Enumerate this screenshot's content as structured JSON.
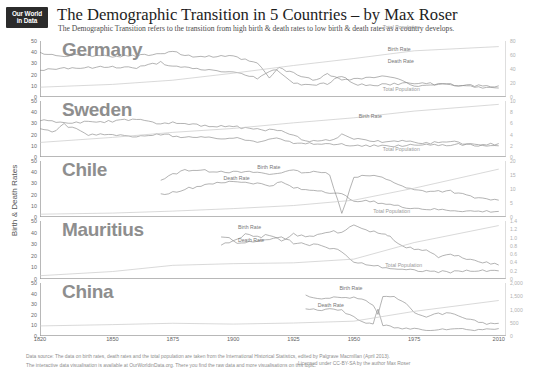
{
  "header": {
    "logo_line1": "Our World",
    "logo_line2": "in Data",
    "title": "The Demographic Transition in 5 Countries – by Max Roser",
    "subtitle": "The Demographic Transition refers to the transition from high birth & death rates to low birth & death rates as a country develops."
  },
  "axes": {
    "y_left_title": "Birth & Death Rates",
    "y_right_title": "Total Population (in Millions)",
    "x_ticks": [
      "1820",
      "1850",
      "1875",
      "1900",
      "1925",
      "1950",
      "1975",
      "2010"
    ]
  },
  "series_labels": {
    "birth": "Birth Rate",
    "death": "Death Rate",
    "population": "Total Population"
  },
  "footer": {
    "line1": "Data source: The data on birth rates, death rates and the total population are taken from the International Historical Statistics, edited by Palgrave Macmillan (April 2013).",
    "line2": "The interactive data visualisation is available at OurWorldinData.org. There you find the raw data and more visualisations on this topic.",
    "license": "Licensed under CC-BY-SA by the author Max Roser"
  },
  "chart_data": {
    "type": "line",
    "title": "The Demographic Transition in 5 Countries – by Max Roser",
    "xlabel": "",
    "ylabel": "Birth & Death Rates",
    "y2label": "Total Population (in Millions)",
    "xlim": [
      1820,
      2013
    ],
    "grid": false,
    "legend_position": "inline-annotations",
    "panels": [
      {
        "country": "Germany",
        "ylim": [
          0,
          50
        ],
        "y_ticks": [
          0,
          10,
          20,
          30,
          40,
          50
        ],
        "y2lim": [
          0,
          80
        ],
        "y2_ticks": [
          "0",
          "20",
          "40",
          "60",
          "80"
        ],
        "series": [
          {
            "name": "Birth Rate",
            "label_x": 1964,
            "label_y": 42,
            "x": [
              1820,
              1830,
              1840,
              1850,
              1860,
              1870,
              1875,
              1880,
              1890,
              1900,
              1910,
              1915,
              1919,
              1925,
              1933,
              1939,
              1945,
              1950,
              1960,
              1965,
              1970,
              1975,
              1980,
              1990,
              2000,
              2010
            ],
            "values": [
              39,
              37,
              37,
              36,
              37,
              39,
              41,
              37,
              36,
              36,
              30,
              17,
              26,
              21,
              15,
              20,
              16,
              16,
              18,
              18,
              14,
              10,
              11,
              11,
              9,
              8
            ]
          },
          {
            "name": "Death Rate",
            "label_x": 1964,
            "label_y": 31,
            "x": [
              1820,
              1830,
              1840,
              1850,
              1860,
              1870,
              1875,
              1880,
              1890,
              1900,
              1910,
              1915,
              1918,
              1925,
              1933,
              1939,
              1945,
              1950,
              1960,
              1970,
              1980,
              1990,
              2000,
              2010
            ],
            "values": [
              24,
              26,
              26,
              27,
              26,
              31,
              27,
              26,
              24,
              22,
              17,
              22,
              25,
              12,
              11,
              12,
              19,
              11,
              11,
              12,
              12,
              11,
              10,
              10
            ]
          },
          {
            "name": "Total Population",
            "label_x": 1962,
            "label_y": 62,
            "x": [
              1820,
              1850,
              1875,
              1900,
              1925,
              1950,
              1975,
              2010
            ],
            "values": [
              14,
              18,
              24,
              34,
              45,
              55,
              66,
              72
            ]
          }
        ]
      },
      {
        "country": "Sweden",
        "ylim": [
          0,
          50
        ],
        "y_ticks": [
          0,
          10,
          20,
          30,
          40,
          50
        ],
        "y2lim": [
          0,
          10
        ],
        "y2_ticks": [
          "0",
          "2",
          "4",
          "6",
          "8",
          "10"
        ],
        "series": [
          {
            "name": "Birth Rate",
            "label_x": 1952,
            "label_y": 36,
            "x": [
              1820,
              1830,
              1840,
              1850,
              1860,
              1870,
              1875,
              1880,
              1890,
              1900,
              1910,
              1920,
              1925,
              1930,
              1935,
              1940,
              1945,
              1950,
              1960,
              1970,
              1980,
              1990,
              2000,
              2010
            ],
            "values": [
              33,
              31,
              31,
              32,
              34,
              29,
              31,
              29,
              28,
              27,
              25,
              23,
              19,
              15,
              14,
              15,
              20,
              16,
              14,
              14,
              12,
              14,
              10,
              12
            ]
          },
          {
            "name": "Death Rate",
            "label_x": 0,
            "label_y": 0,
            "x": [
              1820,
              1825,
              1830,
              1840,
              1850,
              1860,
              1870,
              1875,
              1880,
              1890,
              1900,
              1910,
              1918,
              1925,
              1935,
              1945,
              1950,
              1960,
              1970,
              1980,
              1990,
              2000,
              2010
            ],
            "values": [
              25,
              22,
              29,
              20,
              20,
              18,
              20,
              19,
              18,
              17,
              17,
              14,
              18,
              12,
              12,
              11,
              10,
              10,
              10,
              11,
              11,
              11,
              10
            ]
          },
          {
            "name": "Total Population",
            "label_x": 1962,
            "label_y": 60,
            "x": [
              1820,
              1850,
              1875,
              1900,
              1925,
              1950,
              1975,
              2010
            ],
            "values": [
              2.6,
              3.5,
              4.4,
              5.1,
              6.1,
              7.0,
              8.2,
              9.4
            ]
          }
        ]
      },
      {
        "country": "Chile",
        "ylim": [
          0,
          50
        ],
        "y_ticks": [
          0,
          10,
          20,
          30,
          40,
          50
        ],
        "y2lim": [
          0,
          20
        ],
        "y2_ticks": [
          "0",
          "5",
          "10",
          "15",
          "20"
        ],
        "series": [
          {
            "name": "Birth Rate",
            "label_x": 1910,
            "label_y": 44,
            "x": [
              1870,
              1875,
              1880,
              1885,
              1890,
              1895,
              1900,
              1905,
              1910,
              1915,
              1920,
              1925,
              1930,
              1935,
              1940,
              1945,
              1950,
              1955,
              1960,
              1965,
              1970,
              1975,
              1980,
              1990,
              2000,
              2010
            ],
            "values": [
              33,
              38,
              42,
              42,
              41,
              41,
              40,
              40,
              40,
              38,
              40,
              41,
              40,
              40,
              38,
              3,
              36,
              37,
              36,
              33,
              27,
              24,
              23,
              23,
              17,
              15
            ]
          },
          {
            "name": "Death Rate",
            "label_x": 1896,
            "label_y": 34,
            "x": [
              1870,
              1875,
              1880,
              1885,
              1890,
              1895,
              1900,
              1905,
              1910,
              1915,
              1920,
              1925,
              1930,
              1935,
              1940,
              1945,
              1950,
              1960,
              1970,
              1980,
              1990,
              2000,
              2010
            ],
            "values": [
              20,
              22,
              25,
              27,
              30,
              30,
              32,
              31,
              30,
              28,
              31,
              26,
              24,
              24,
              22,
              20,
              15,
              13,
              9,
              7,
              6,
              5,
              5
            ]
          },
          {
            "name": "Total Population",
            "label_x": 1962,
            "label_y": 60,
            "x": [
              1820,
              1850,
              1875,
              1900,
              1925,
              1950,
              1975,
              2010
            ],
            "values": [
              1.0,
              1.4,
              2.1,
              3.0,
              4.1,
              6.0,
              10.3,
              17.1
            ]
          }
        ]
      },
      {
        "country": "Mauritius",
        "ylim": [
          0,
          50
        ],
        "y_ticks": [
          0,
          10,
          20,
          30,
          40,
          50
        ],
        "y2lim": [
          0,
          1.4
        ],
        "y2_ticks": [
          "0",
          "0.2",
          "0.4",
          "0.6",
          "0.8",
          "1.0",
          "1.2",
          "1.4"
        ],
        "series": [
          {
            "name": "Birth Rate",
            "label_x": 1902,
            "label_y": 44,
            "x": [
              1895,
              1900,
              1905,
              1910,
              1915,
              1920,
              1925,
              1930,
              1935,
              1940,
              1945,
              1950,
              1955,
              1960,
              1963,
              1965,
              1970,
              1975,
              1980,
              1985,
              1990,
              2000,
              2010
            ],
            "values": [
              36,
              34,
              38,
              36,
              38,
              33,
              39,
              36,
              38,
              41,
              40,
              47,
              42,
              40,
              39,
              36,
              28,
              26,
              25,
              19,
              21,
              16,
              12
            ]
          },
          {
            "name": "Death Rate",
            "label_x": 1902,
            "label_y": 33,
            "x": [
              1895,
              1900,
              1905,
              1910,
              1915,
              1920,
              1925,
              1930,
              1935,
              1940,
              1945,
              1950,
              1955,
              1960,
              1970,
              1980,
              1990,
              2000,
              2010
            ],
            "values": [
              30,
              32,
              31,
              33,
              34,
              36,
              31,
              30,
              29,
              27,
              24,
              14,
              13,
              11,
              8,
              7,
              6,
              7,
              7
            ]
          },
          {
            "name": "Total Population",
            "label_x": 1958,
            "label_y": 58,
            "x": [
              1820,
              1850,
              1875,
              1900,
              1925,
              1950,
              1975,
              2010
            ],
            "values": [
              0.08,
              0.18,
              0.33,
              0.37,
              0.39,
              0.48,
              0.88,
              1.29
            ]
          }
        ]
      },
      {
        "country": "China",
        "ylim": [
          0,
          50
        ],
        "y_ticks": [
          0,
          10,
          20,
          30,
          40,
          50
        ],
        "y2lim": [
          0,
          2000
        ],
        "y2_ticks": [
          "0",
          "500",
          "1,000",
          "1,500",
          "2,000"
        ],
        "series": [
          {
            "name": "Birth Rate",
            "label_x": 1944,
            "label_y": 44,
            "x": [
              1930,
              1935,
              1940,
              1945,
              1950,
              1955,
              1958,
              1960,
              1962,
              1965,
              1970,
              1975,
              1980,
              1985,
              1990,
              1995,
              2000,
              2005,
              2010
            ],
            "values": [
              38,
              36,
              36,
              36,
              37,
              34,
              29,
              21,
              37,
              38,
              33,
              23,
              18,
              21,
              21,
              17,
              14,
              12,
              12
            ]
          },
          {
            "name": "Death Rate",
            "label_x": 1935,
            "label_y": 28,
            "x": [
              1930,
              1935,
              1940,
              1945,
              1950,
              1955,
              1958,
              1960,
              1962,
              1965,
              1970,
              1975,
              1980,
              1990,
              2000,
              2010
            ],
            "values": [
              26,
              25,
              25,
              24,
              18,
              12,
              12,
              25,
              10,
              9,
              7,
              7,
              6,
              7,
              6,
              7
            ]
          },
          {
            "name": "Total Population",
            "label_x": 1963,
            "label_y": 66,
            "x": [
              1820,
              1850,
              1875,
              1900,
              1925,
              1950,
              1975,
              2010
            ],
            "values": [
              380,
              430,
              480,
              450,
              490,
              560,
              930,
              1340
            ]
          }
        ]
      }
    ]
  }
}
